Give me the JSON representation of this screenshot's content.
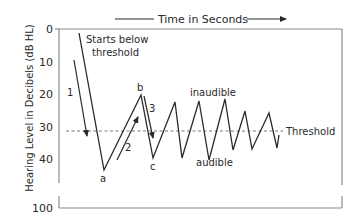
{
  "header": {
    "time_label": "Time in Seconds"
  },
  "axis": {
    "y_label": "Hearing Level in Decibels (dB HL)",
    "ticks": [
      {
        "label": "0",
        "y": 29
      },
      {
        "label": "10",
        "y": 62
      },
      {
        "label": "20",
        "y": 94
      },
      {
        "label": "30",
        "y": 127
      },
      {
        "label": "40",
        "y": 159
      },
      {
        "label": "100",
        "y": 208
      }
    ]
  },
  "threshold": {
    "label": "Threshold"
  },
  "annotations": {
    "start": [
      "Starts below",
      "threshold"
    ],
    "inaudible": "inaudible",
    "audible": "audible",
    "point_a": "a",
    "point_b": "b",
    "point_c": "c",
    "step_1": "1",
    "step_2": "2",
    "step_3": "3"
  },
  "colors": {
    "line": "#2a2a2a",
    "dash": "#777777",
    "frame": "#8a8a8a"
  }
}
